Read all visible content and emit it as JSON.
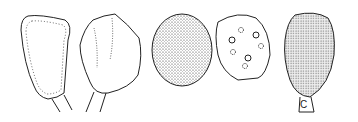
{
  "illustration": {
    "description": "Botanical line drawing of five seed/spore-like structures",
    "panel_label": "C",
    "colors": {
      "ink": "#222222",
      "background": "#ffffff"
    }
  }
}
